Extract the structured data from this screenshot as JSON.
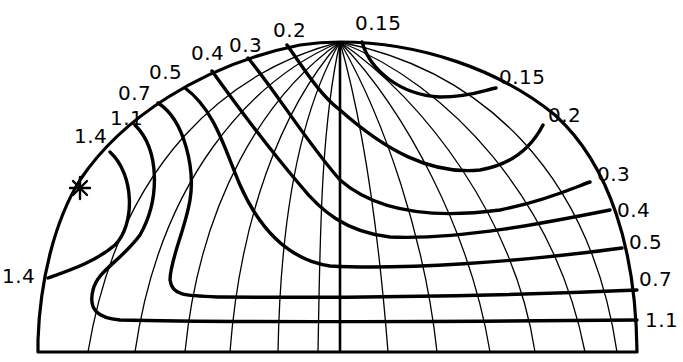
{
  "diagram": {
    "type": "hemispherical contour plot (isoline projection)",
    "apex_label": "0.15",
    "left_labels": [
      {
        "text": "1.4",
        "x": 2,
        "y": 283
      },
      {
        "text": "1.4",
        "x": 74,
        "y": 143
      },
      {
        "text": "1.1",
        "x": 110,
        "y": 125
      },
      {
        "text": "0.7",
        "x": 118,
        "y": 100
      },
      {
        "text": "0.5",
        "x": 149,
        "y": 79
      },
      {
        "text": "0.4",
        "x": 191,
        "y": 60
      },
      {
        "text": "0.3",
        "x": 229,
        "y": 52
      },
      {
        "text": "0.2",
        "x": 273,
        "y": 37
      }
    ],
    "top_label": {
      "text": "0.15",
      "x": 355,
      "y": 30
    },
    "right_labels": [
      {
        "text": "0.15",
        "x": 499,
        "y": 84
      },
      {
        "text": "0.2",
        "x": 548,
        "y": 122
      },
      {
        "text": "0.3",
        "x": 597,
        "y": 181
      },
      {
        "text": "0.4",
        "x": 617,
        "y": 217
      },
      {
        "text": "0.5",
        "x": 629,
        "y": 249
      },
      {
        "text": "0.7",
        "x": 639,
        "y": 286
      },
      {
        "text": "1.1",
        "x": 645,
        "y": 327
      }
    ],
    "marker": {
      "symbol": "star",
      "x": 80,
      "y": 188
    },
    "colors": {
      "ink": "#000000",
      "background": "#ffffff"
    }
  }
}
